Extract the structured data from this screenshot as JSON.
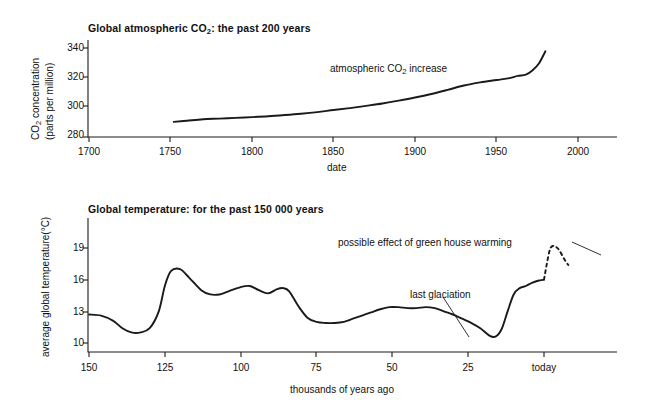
{
  "figure": {
    "background": "#ffffff",
    "ink": "#1a1a1a"
  },
  "chart_data": [
    {
      "id": "co2",
      "type": "line",
      "title_plain": "Global atmospheric CO2: the past 200 years",
      "title_prefix": "Global atmospheric CO",
      "title_sub": "2",
      "title_suffix": ": the past 200 years",
      "xlabel": "date",
      "ylabel_line1": "CO2 concentration",
      "ylabel_line1_prefix": "CO",
      "ylabel_line1_sub": "2",
      "ylabel_line1_suffix": " concentration",
      "ylabel_line2": "(parts per million)",
      "xlim": [
        1680,
        2000
      ],
      "ylim": [
        280,
        345
      ],
      "xticks": [
        "1700",
        "1750",
        "1800",
        "1850",
        "1900",
        "1950",
        "2000"
      ],
      "xtick_values": [
        1700,
        1750,
        1800,
        1850,
        1900,
        1950,
        2000
      ],
      "yticks": [
        "280",
        "300",
        "320",
        "340"
      ],
      "ytick_values": [
        280,
        300,
        320,
        340
      ],
      "grid": false,
      "legend": "none",
      "annotations": [
        {
          "text_plain": "atmospheric CO2 increase",
          "text_prefix": "atmospheric CO",
          "text_sub": "2",
          "text_suffix": " increase",
          "x": 1840,
          "y": 318
        }
      ],
      "series": [
        {
          "name": "atmospheric CO2 increase",
          "style": "solid",
          "x": [
            1752,
            1760,
            1770,
            1780,
            1790,
            1800,
            1810,
            1820,
            1830,
            1840,
            1850,
            1860,
            1870,
            1880,
            1890,
            1900,
            1910,
            1920,
            1930,
            1940,
            1950,
            1958,
            1963,
            1968,
            1972,
            1976,
            1980
          ],
          "y": [
            290.2,
            291.0,
            292.0,
            292.4,
            292.9,
            293.4,
            294.0,
            294.8,
            295.7,
            296.8,
            298.2,
            299.5,
            301.0,
            302.6,
            304.5,
            306.6,
            309.0,
            311.8,
            314.7,
            316.8,
            318.4,
            319.7,
            321.2,
            322.0,
            324.8,
            329.5,
            337.8
          ]
        }
      ]
    },
    {
      "id": "temperature",
      "type": "line",
      "title_plain": "Global temperature: for the past 150 000 years",
      "xlabel": "thousands of years ago",
      "ylabel_plain": "average global temperature(°C)",
      "ylabel_prefix": "average global temperature(",
      "ylabel_degree": "°C)",
      "xlim_kya": [
        152,
        -12
      ],
      "ylim": [
        9,
        21
      ],
      "xticks": [
        "150",
        "125",
        "100",
        "75",
        "50",
        "25",
        "today"
      ],
      "xtick_values": [
        150,
        125,
        100,
        75,
        50,
        25,
        0
      ],
      "yticks": [
        "10",
        "13",
        "16",
        "19"
      ],
      "ytick_values": [
        10,
        13,
        16,
        19
      ],
      "grid": false,
      "legend": "none",
      "annotations": [
        {
          "text": "possible effect of green house warming",
          "target_kya": -1,
          "target_temp": 19.0
        },
        {
          "text": "last glaciation",
          "target_kya": 18,
          "target_temp": 10.6
        }
      ],
      "series": [
        {
          "name": "average global temperature",
          "style": "solid",
          "x_kya": [
            150,
            146,
            142,
            139,
            136,
            133,
            130,
            127,
            125,
            123,
            120,
            117,
            113,
            110,
            107,
            104,
            100,
            97,
            94,
            91,
            88,
            86,
            84,
            81,
            78,
            75,
            72,
            69,
            66,
            63,
            60,
            57,
            54,
            51,
            48,
            45,
            42,
            39,
            36,
            33,
            30,
            27,
            24,
            21,
            18,
            16,
            14,
            12,
            10,
            8,
            6,
            4,
            2,
            0
          ],
          "y": [
            12.7,
            12.6,
            12.1,
            11.4,
            11.0,
            11.0,
            11.4,
            13.0,
            15.4,
            16.8,
            17.0,
            16.2,
            15.0,
            14.6,
            14.6,
            14.9,
            15.3,
            15.4,
            15.0,
            14.7,
            15.1,
            15.2,
            14.9,
            13.5,
            12.4,
            12.0,
            11.9,
            11.9,
            12.0,
            12.3,
            12.6,
            12.9,
            13.2,
            13.4,
            13.4,
            13.3,
            13.3,
            13.4,
            13.3,
            13.0,
            12.7,
            12.3,
            11.9,
            11.4,
            10.7,
            10.6,
            11.3,
            13.0,
            14.6,
            15.2,
            15.4,
            15.7,
            15.9,
            16.0
          ]
        },
        {
          "name": "possible effect of green house warming",
          "style": "dashed",
          "x_kya": [
            0,
            -1,
            -2,
            -3,
            -4,
            -5,
            -6,
            -7,
            -8
          ],
          "y": [
            16.0,
            17.6,
            18.9,
            19.2,
            19.1,
            18.8,
            18.3,
            17.8,
            17.4
          ]
        }
      ]
    }
  ]
}
